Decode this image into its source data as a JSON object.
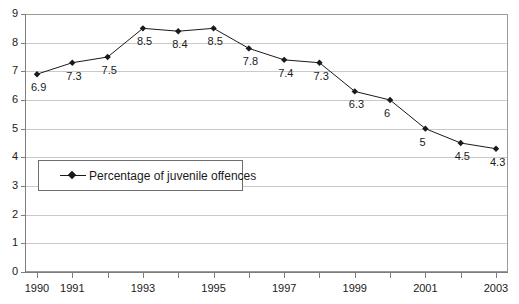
{
  "chart_data": {
    "type": "line",
    "title": "",
    "subtitle": "",
    "xlabel": "",
    "ylabel": "",
    "x": [
      1990,
      1991,
      1992,
      1993,
      1994,
      1995,
      1996,
      1997,
      1998,
      1999,
      2000,
      2001,
      2002,
      2003
    ],
    "categories": [
      "1990",
      "1991",
      "1992",
      "1993",
      "1994",
      "1995",
      "1996",
      "1997",
      "1998",
      "1999",
      "2000",
      "2001",
      "2002",
      "2003"
    ],
    "values": [
      6.9,
      7.3,
      7.5,
      8.5,
      8.4,
      8.5,
      7.8,
      7.4,
      7.3,
      6.3,
      6,
      5,
      4.5,
      4.3
    ],
    "point_labels": [
      "6.9",
      "7.3",
      "7.5",
      "8.5",
      "8.4",
      "8.5",
      "7.8",
      "7.4",
      "7.3",
      "6.3",
      "6",
      "5",
      "4.5",
      "4.3"
    ],
    "series": [
      {
        "name": "Percentage of juvenile offences",
        "values": [
          6.9,
          7.3,
          7.5,
          8.5,
          8.4,
          8.5,
          7.8,
          7.4,
          7.3,
          6.3,
          6,
          5,
          4.5,
          4.3
        ],
        "color": "#1a1a1a",
        "marker": "diamond"
      }
    ],
    "ylim": [
      0,
      9
    ],
    "yticks": [
      "0",
      "1",
      "2",
      "3",
      "4",
      "5",
      "6",
      "7",
      "8",
      "9"
    ],
    "xtick_labels_visible": [
      "1990",
      "1991",
      "1993",
      "1995",
      "1997",
      "1999",
      "2001",
      "2003"
    ],
    "grid": true,
    "grid_axis": "y",
    "grid_color": "#c9c9c9",
    "legend": {
      "position": "inside-left",
      "entries": [
        "Percentage of juvenile offences"
      ]
    },
    "plot_background": "#ffffff",
    "axis_color": "#7d7d7d"
  }
}
